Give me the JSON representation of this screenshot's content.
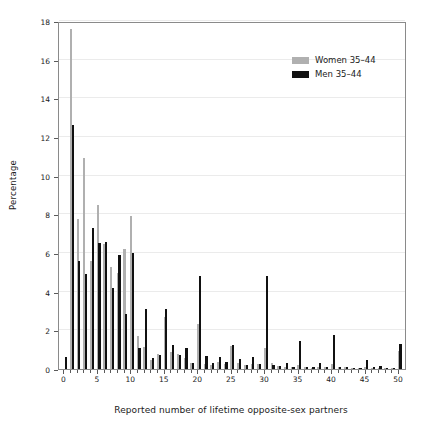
{
  "chart_data": {
    "type": "bar",
    "title": "",
    "xlabel": "Reported number of lifetime opposite-sex partners",
    "ylabel": "Percentage",
    "xlim": [
      -0.8,
      51.2
    ],
    "ylim": [
      0,
      18
    ],
    "yticks": [
      0,
      2,
      4,
      6,
      8,
      10,
      12,
      14,
      16,
      18
    ],
    "xticks": [
      0,
      5,
      10,
      15,
      20,
      25,
      30,
      35,
      40,
      45,
      50
    ],
    "xtick_step_minor": 1,
    "grid": "horizontal",
    "legend_position": "top-right",
    "colors": {
      "women": "#b0b0b0",
      "men": "#111111",
      "axis": "#8a8a8a",
      "grid": "#ebebeb"
    },
    "x": [
      0,
      1,
      2,
      3,
      4,
      5,
      6,
      7,
      8,
      9,
      10,
      11,
      12,
      13,
      14,
      15,
      16,
      17,
      18,
      19,
      20,
      21,
      22,
      23,
      24,
      25,
      26,
      27,
      28,
      29,
      30,
      31,
      32,
      33,
      34,
      35,
      36,
      37,
      38,
      39,
      40,
      41,
      42,
      43,
      44,
      45,
      46,
      47,
      48,
      49,
      50
    ],
    "series": [
      {
        "name": "Women 35–44",
        "key": "women",
        "color": "#b0b0b0",
        "values": [
          0.0,
          17.6,
          7.75,
          10.9,
          5.6,
          8.5,
          6.45,
          5.3,
          4.95,
          6.2,
          7.9,
          1.7,
          1.15,
          0.45,
          0.8,
          2.7,
          0.9,
          0.8,
          0.55,
          0.3,
          2.35,
          0.25,
          0.2,
          0.35,
          0.25,
          1.2,
          0.3,
          0.2,
          0.25,
          0.25,
          1.1,
          0.3,
          0.15,
          0.1,
          0.1,
          0.2,
          0.1,
          0.05,
          0.1,
          0.1,
          0.25,
          0.1,
          0.08,
          0.05,
          0.05,
          0.1,
          0.05,
          0.05,
          0.05,
          0.05,
          0.95
        ]
      },
      {
        "name": "Men 35–44",
        "key": "men",
        "color": "#111111",
        "values": [
          0.6,
          12.6,
          5.6,
          4.9,
          7.3,
          6.5,
          6.55,
          4.2,
          5.9,
          2.85,
          6.0,
          1.1,
          3.1,
          0.55,
          0.75,
          3.1,
          1.25,
          0.75,
          1.1,
          0.3,
          4.8,
          0.65,
          0.3,
          0.6,
          0.35,
          1.25,
          0.5,
          0.2,
          0.6,
          0.25,
          4.8,
          0.2,
          0.15,
          0.3,
          0.1,
          1.45,
          0.1,
          0.08,
          0.3,
          0.1,
          1.75,
          0.1,
          0.08,
          0.05,
          0.05,
          0.45,
          0.08,
          0.15,
          0.05,
          0.05,
          1.3
        ]
      }
    ]
  },
  "legend": {
    "items": [
      {
        "label": "Women 35–44",
        "key": "women"
      },
      {
        "label": "Men 35–44",
        "key": "men"
      }
    ]
  }
}
